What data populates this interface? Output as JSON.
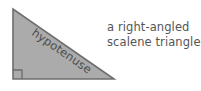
{
  "figure": {
    "background_color": "#ffffff",
    "width": 201,
    "height": 91,
    "shape": {
      "name": "right-angled scalene triangle",
      "fill_color": "#ababab",
      "stroke_color": "#6e6e6e",
      "vertices": [
        {
          "x": 13,
          "y": 9
        },
        {
          "x": 13,
          "y": 79
        },
        {
          "x": 114,
          "y": 79
        }
      ]
    },
    "right_angle_marker": {
      "size": 9,
      "stroke_color": "#6b6b6b",
      "corner": {
        "x": 13,
        "y": 79
      }
    },
    "edge_label": {
      "text": "hypotenuse",
      "color": "#4d4d4d",
      "rotation_degrees": 34.7
    },
    "caption": {
      "color": "#555555",
      "lines": [
        "a right-angled",
        "scalene triangle"
      ]
    }
  }
}
